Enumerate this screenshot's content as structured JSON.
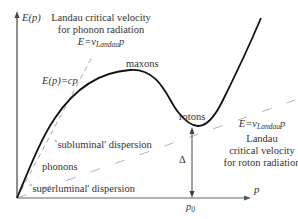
{
  "axes": {
    "y_label": "E(p)",
    "x_label": "p",
    "x_tick_label": "p0",
    "x_tick_base": "p",
    "x_tick_sub": "0"
  },
  "curve_labels": {
    "maxons": "maxons",
    "rotons": "rotons",
    "phonons": "phonons",
    "gap": "Δ"
  },
  "lines": {
    "linear_dispersion": "E(p)=cp",
    "subluminal": "`subluminal' dispersion",
    "superluminal": "`superluminal' dispersion"
  },
  "phonon_annotation": {
    "line1": "Landau critical velocity",
    "line2": "for phonon radiation",
    "formula_prefix": "E=v",
    "formula_sub": "Landau",
    "formula_suffix": "p"
  },
  "roton_annotation": {
    "formula_prefix": "E=v",
    "formula_sub": "Landau",
    "formula_suffix": "p",
    "line1": "Landau",
    "line2": "critical velocity",
    "line3": "for roton radiation"
  },
  "colors": {
    "curve": "#111111",
    "dashed": "#999999",
    "axis": "#555555",
    "text": "#333333"
  }
}
